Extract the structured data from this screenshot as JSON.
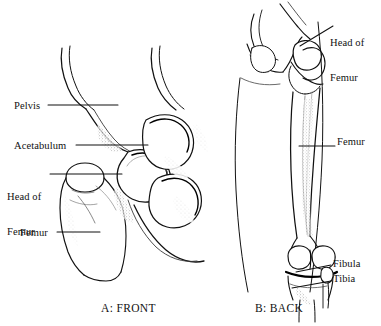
{
  "figure": {
    "background_color": "#ffffff",
    "ink_color": "#111111",
    "panels": [
      {
        "id": "panel-a",
        "caption": "A: FRONT",
        "subject": "hip joint and proximal femur, anterior view",
        "labels": [
          {
            "name": "pelvis",
            "text": "Pelvis",
            "lines": [
              "Pelvis"
            ]
          },
          {
            "name": "acetabulum",
            "text": "Acetabulum",
            "lines": [
              "Acetabulum"
            ]
          },
          {
            "name": "head-of-femur",
            "text": "Head of Femur",
            "lines": [
              "Head of",
              "Femur"
            ]
          },
          {
            "name": "femur",
            "text": "Femur",
            "lines": [
              "Femur"
            ]
          }
        ]
      },
      {
        "id": "panel-b",
        "caption": "B: BACK",
        "subject": "full femur within thigh outline and knee joint, posterior view",
        "labels": [
          {
            "name": "head-of-femur",
            "text": "Head of Femur",
            "lines": [
              "Head of",
              "Femur"
            ]
          },
          {
            "name": "femur",
            "text": "Femur",
            "lines": [
              "Femur"
            ]
          },
          {
            "name": "fibula",
            "text": "Fibula",
            "lines": [
              "Fibula"
            ]
          },
          {
            "name": "tibia",
            "text": "Tibia",
            "lines": [
              "Tibia"
            ]
          }
        ]
      }
    ],
    "labels_flat": {
      "pelvis": "Pelvis",
      "acetabulum": "Acetabulum",
      "head_of_femur_line1": "Head of",
      "head_of_femur_line2": "Femur",
      "femur_a": "Femur",
      "head_of_femur_b_line1": "Head of",
      "head_of_femur_b_line2": "Femur",
      "femur_b": "Femur",
      "fibula": "Fibula",
      "tibia": "Tibia"
    },
    "captions": {
      "panel_a": "A: FRONT",
      "panel_b": "B: BACK"
    }
  }
}
